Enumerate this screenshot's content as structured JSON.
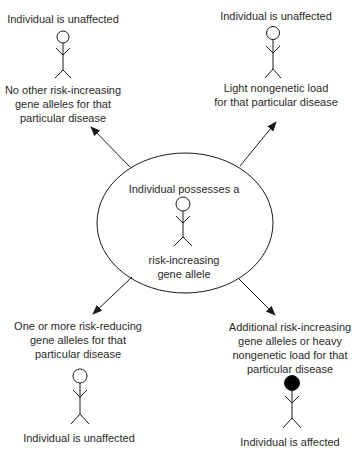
{
  "diagram": {
    "center": {
      "label_top": "Individual possesses a",
      "label_bottom_lines": [
        "risk-increasing",
        "gene allele"
      ],
      "figure": "unfilled"
    },
    "outcomes": [
      {
        "position": "top-left",
        "result": "Individual is unaffected",
        "condition_lines": [
          "No other risk-increasing",
          "gene alleles for that",
          "particular disease"
        ],
        "figure": "unfilled"
      },
      {
        "position": "top-right",
        "result": "Individual is unaffected",
        "condition_lines": [
          "Light nongenetic load",
          "for that particular disease"
        ],
        "figure": "unfilled"
      },
      {
        "position": "bottom-left",
        "condition_lines": [
          "One or more risk-reducing",
          "gene alleles for that",
          "particular disease"
        ],
        "result": "Individual is unaffected",
        "figure": "unfilled"
      },
      {
        "position": "bottom-right",
        "condition_lines": [
          "Additional risk-increasing",
          "gene alleles or heavy",
          "nongenetic load for that",
          "particular disease"
        ],
        "result": "Individual is affected",
        "figure": "filled"
      }
    ],
    "colors": {
      "line": "#1a1a1a",
      "text": "#2a2a2a",
      "affected_fill": "#000000",
      "background": "#ffffff"
    }
  }
}
